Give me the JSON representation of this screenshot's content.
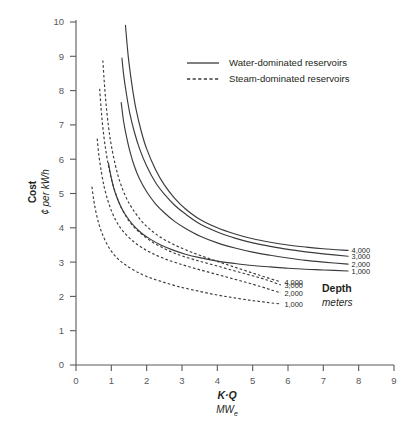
{
  "chart_data": {
    "type": "line",
    "title": "",
    "xlabel": "K·Q",
    "xlabel_sub": "MW",
    "xlabel_sub_script": "e",
    "ylabel_bold": "Cost",
    "ylabel_italic": "¢ per kWh",
    "xlim": [
      0,
      9
    ],
    "ylim": [
      0,
      10
    ],
    "xticks": [
      "0",
      "1",
      "2",
      "3",
      "4",
      "5",
      "6",
      "7",
      "8",
      "9"
    ],
    "yticks": [
      "0",
      "1",
      "2",
      "3",
      "4",
      "5",
      "6",
      "7",
      "8",
      "9",
      "10"
    ],
    "grid": false,
    "legend_position": "top-center",
    "legend": [
      {
        "label": "Water-dominated reservoirs",
        "style": "solid"
      },
      {
        "label": "Steam-dominated reservoirs",
        "style": "dashed"
      }
    ],
    "annotations": {
      "depth_title": "Depth",
      "depth_units": "meters"
    },
    "series": [
      {
        "name": "Water-dominated 4,000 m",
        "style": "solid",
        "end_label": "4,000",
        "points": [
          [
            1.4,
            9.9
          ],
          [
            1.45,
            9.3
          ],
          [
            1.5,
            8.8
          ],
          [
            1.6,
            8.05
          ],
          [
            1.7,
            7.45
          ],
          [
            1.85,
            6.8
          ],
          [
            2.0,
            6.3
          ],
          [
            2.25,
            5.7
          ],
          [
            2.5,
            5.25
          ],
          [
            2.8,
            4.85
          ],
          [
            3.1,
            4.55
          ],
          [
            3.5,
            4.25
          ],
          [
            4.0,
            4.0
          ],
          [
            4.5,
            3.82
          ],
          [
            5.0,
            3.68
          ],
          [
            5.5,
            3.58
          ],
          [
            6.0,
            3.5
          ],
          [
            6.5,
            3.44
          ],
          [
            7.0,
            3.39
          ],
          [
            7.7,
            3.34
          ]
        ]
      },
      {
        "name": "Water-dominated 3,000 m",
        "style": "solid",
        "end_label": "3,000",
        "points": [
          [
            1.3,
            8.95
          ],
          [
            1.35,
            8.45
          ],
          [
            1.42,
            7.95
          ],
          [
            1.52,
            7.35
          ],
          [
            1.65,
            6.8
          ],
          [
            1.8,
            6.3
          ],
          [
            2.0,
            5.8
          ],
          [
            2.25,
            5.32
          ],
          [
            2.5,
            4.98
          ],
          [
            2.8,
            4.65
          ],
          [
            3.1,
            4.4
          ],
          [
            3.5,
            4.12
          ],
          [
            4.0,
            3.88
          ],
          [
            4.5,
            3.7
          ],
          [
            5.0,
            3.56
          ],
          [
            5.5,
            3.46
          ],
          [
            6.0,
            3.37
          ],
          [
            6.5,
            3.3
          ],
          [
            7.0,
            3.24
          ],
          [
            7.7,
            3.17
          ]
        ]
      },
      {
        "name": "Water-dominated 2,000 m",
        "style": "solid",
        "end_label": "2,000",
        "points": [
          [
            1.28,
            7.65
          ],
          [
            1.34,
            7.15
          ],
          [
            1.42,
            6.7
          ],
          [
            1.52,
            6.25
          ],
          [
            1.65,
            5.8
          ],
          [
            1.8,
            5.42
          ],
          [
            2.0,
            5.05
          ],
          [
            2.25,
            4.7
          ],
          [
            2.5,
            4.44
          ],
          [
            2.8,
            4.18
          ],
          [
            3.1,
            3.98
          ],
          [
            3.5,
            3.76
          ],
          [
            4.0,
            3.56
          ],
          [
            4.5,
            3.41
          ],
          [
            5.0,
            3.29
          ],
          [
            5.5,
            3.2
          ],
          [
            6.0,
            3.12
          ],
          [
            6.5,
            3.05
          ],
          [
            7.0,
            3.0
          ],
          [
            7.7,
            2.94
          ]
        ]
      },
      {
        "name": "Water-dominated 1,000 m",
        "style": "solid",
        "end_label": "1,000",
        "points": [
          [
            0.92,
            5.88
          ],
          [
            1.0,
            5.45
          ],
          [
            1.1,
            5.05
          ],
          [
            1.25,
            4.66
          ],
          [
            1.4,
            4.38
          ],
          [
            1.6,
            4.1
          ],
          [
            1.85,
            3.85
          ],
          [
            2.1,
            3.67
          ],
          [
            2.4,
            3.5
          ],
          [
            2.75,
            3.35
          ],
          [
            3.1,
            3.23
          ],
          [
            3.5,
            3.13
          ],
          [
            4.0,
            3.03
          ],
          [
            4.5,
            2.96
          ],
          [
            5.0,
            2.9
          ],
          [
            5.5,
            2.86
          ],
          [
            6.0,
            2.82
          ],
          [
            6.5,
            2.79
          ],
          [
            7.0,
            2.77
          ],
          [
            7.7,
            2.74
          ]
        ]
      },
      {
        "name": "Steam-dominated 4,000 m",
        "style": "dashed",
        "end_label": "4,000",
        "points": [
          [
            0.76,
            8.88
          ],
          [
            0.8,
            8.25
          ],
          [
            0.85,
            7.62
          ],
          [
            0.92,
            6.95
          ],
          [
            1.0,
            6.4
          ],
          [
            1.12,
            5.8
          ],
          [
            1.25,
            5.32
          ],
          [
            1.42,
            4.88
          ],
          [
            1.6,
            4.55
          ],
          [
            1.85,
            4.2
          ],
          [
            2.1,
            3.95
          ],
          [
            2.4,
            3.72
          ],
          [
            2.75,
            3.52
          ],
          [
            3.1,
            3.36
          ],
          [
            3.5,
            3.2
          ],
          [
            4.0,
            3.02
          ],
          [
            4.5,
            2.85
          ],
          [
            5.0,
            2.68
          ],
          [
            5.4,
            2.55
          ],
          [
            5.8,
            2.42
          ]
        ]
      },
      {
        "name": "Steam-dominated 3,000 m",
        "style": "dashed",
        "end_label": "3,000",
        "points": [
          [
            0.67,
            8.05
          ],
          [
            0.71,
            7.48
          ],
          [
            0.76,
            6.92
          ],
          [
            0.83,
            6.35
          ],
          [
            0.92,
            5.8
          ],
          [
            1.02,
            5.35
          ],
          [
            1.15,
            4.92
          ],
          [
            1.3,
            4.55
          ],
          [
            1.5,
            4.2
          ],
          [
            1.72,
            3.94
          ],
          [
            2.0,
            3.7
          ],
          [
            2.3,
            3.5
          ],
          [
            2.65,
            3.32
          ],
          [
            3.0,
            3.18
          ],
          [
            3.45,
            3.04
          ],
          [
            3.95,
            2.9
          ],
          [
            4.5,
            2.74
          ],
          [
            5.0,
            2.6
          ],
          [
            5.4,
            2.48
          ],
          [
            5.8,
            2.33
          ]
        ]
      },
      {
        "name": "Steam-dominated 2,000 m",
        "style": "dashed",
        "end_label": "2,000",
        "points": [
          [
            0.6,
            6.6
          ],
          [
            0.65,
            6.1
          ],
          [
            0.72,
            5.62
          ],
          [
            0.8,
            5.18
          ],
          [
            0.9,
            4.8
          ],
          [
            1.02,
            4.45
          ],
          [
            1.18,
            4.12
          ],
          [
            1.35,
            3.88
          ],
          [
            1.58,
            3.64
          ],
          [
            1.85,
            3.43
          ],
          [
            2.15,
            3.26
          ],
          [
            2.5,
            3.1
          ],
          [
            2.9,
            2.96
          ],
          [
            3.35,
            2.82
          ],
          [
            3.85,
            2.68
          ],
          [
            4.35,
            2.54
          ],
          [
            4.85,
            2.4
          ],
          [
            5.25,
            2.28
          ],
          [
            5.55,
            2.18
          ],
          [
            5.8,
            2.1
          ]
        ]
      },
      {
        "name": "Steam-dominated 1,000 m",
        "style": "dashed",
        "end_label": "1,000",
        "points": [
          [
            0.45,
            5.2
          ],
          [
            0.5,
            4.82
          ],
          [
            0.56,
            4.48
          ],
          [
            0.64,
            4.14
          ],
          [
            0.73,
            3.86
          ],
          [
            0.85,
            3.58
          ],
          [
            1.0,
            3.32
          ],
          [
            1.18,
            3.1
          ],
          [
            1.4,
            2.92
          ],
          [
            1.68,
            2.74
          ],
          [
            2.0,
            2.58
          ],
          [
            2.4,
            2.44
          ],
          [
            2.85,
            2.3
          ],
          [
            3.35,
            2.18
          ],
          [
            3.9,
            2.06
          ],
          [
            4.4,
            1.97
          ],
          [
            4.9,
            1.89
          ],
          [
            5.3,
            1.84
          ],
          [
            5.6,
            1.8
          ],
          [
            5.8,
            1.78
          ]
        ]
      }
    ]
  }
}
